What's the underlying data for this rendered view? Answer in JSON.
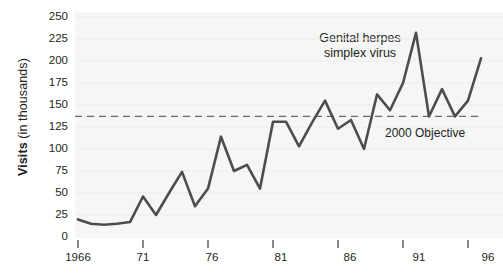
{
  "chart_data": {
    "type": "line",
    "title": "",
    "subtitle": "",
    "xlabel": "",
    "ylabel": "Visits (in thousands)",
    "ylabel_bold_part": "Visits",
    "ylabel_rest": " (in thousands)",
    "ylim": [
      0,
      250
    ],
    "yticks": [
      0,
      25,
      50,
      75,
      100,
      125,
      150,
      175,
      200,
      225,
      250
    ],
    "xlim": [
      1966,
      1997
    ],
    "xticks": [
      1966,
      1971,
      1976,
      1981,
      1986,
      1991,
      1996
    ],
    "xtick_labels": [
      "1966",
      "71",
      "76",
      "81",
      "86",
      "91",
      "96"
    ],
    "grid": "horizontal-light",
    "legend": "none",
    "x": [
      1966,
      1967,
      1968,
      1969,
      1970,
      1971,
      1972,
      1973,
      1974,
      1975,
      1976,
      1977,
      1978,
      1979,
      1980,
      1981,
      1982,
      1983,
      1984,
      1985,
      1986,
      1987,
      1988,
      1989,
      1990,
      1991,
      1992,
      1993,
      1994,
      1995,
      1996,
      1997
    ],
    "series": [
      {
        "name": "Genital herpes simplex virus",
        "color": "#4d4d4d",
        "values": [
          20,
          15,
          14,
          15,
          17,
          46,
          25,
          50,
          74,
          35,
          55,
          114,
          75,
          82,
          55,
          131,
          131,
          103,
          130,
          155,
          123,
          133,
          100,
          162,
          144,
          175,
          232,
          137,
          168,
          137,
          155,
          203
        ]
      }
    ],
    "reference_lines": [
      {
        "label": "2000 Objective",
        "value": 137,
        "style": "dashed",
        "color": "#6b6b6b"
      }
    ],
    "annotations": [
      {
        "name": "series-label",
        "line1": "Genital herpes",
        "line2": "simplex virus",
        "x": 1989.6,
        "y": 225
      },
      {
        "name": "objective-label",
        "text": "2000 Objective",
        "x": 1993.2,
        "y": 124
      }
    ]
  }
}
